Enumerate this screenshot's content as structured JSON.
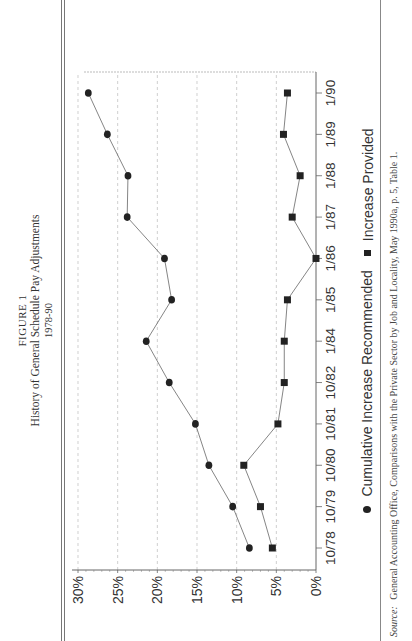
{
  "figure": {
    "label": "FIGURE 1",
    "title": "History of General Schedule Pay Adjustments",
    "subtitle": "1978-90"
  },
  "legend": {
    "items": [
      {
        "marker": "circle",
        "label": "Cumulative Increase Recommended"
      },
      {
        "marker": "square",
        "label": "Increase Provided"
      }
    ]
  },
  "source": {
    "label": "Source:",
    "text": "General Accounting Office, Comparisons with the Private Sector by Job and Locality, May 1990a, p. 5, Table 1."
  },
  "colors": {
    "marker": "#222222",
    "line": "#666666",
    "grid": "#bbbbbb",
    "axis": "#666666",
    "text": "#333333"
  },
  "chart_data": {
    "type": "line",
    "orientation": "rotated 90 degrees counter-clockwise on page",
    "title": "History of General Schedule Pay Adjustments",
    "subtitle": "1978-90",
    "xlabel": "",
    "ylabel": "",
    "categories": [
      "10/78",
      "10/79",
      "10/80",
      "10/81",
      "10/82",
      "1/84",
      "1/85",
      "1/86",
      "1/87",
      "1/88",
      "1/89",
      "1/90"
    ],
    "series": [
      {
        "name": "Cumulative Increase Recommended",
        "marker": "circle",
        "values": [
          8.4,
          10.5,
          13.5,
          15.2,
          18.5,
          21.4,
          18.2,
          19.1,
          23.8,
          23.7,
          26.3,
          28.7
        ]
      },
      {
        "name": "Increase Provided",
        "marker": "square",
        "values": [
          5.5,
          7.0,
          9.1,
          4.8,
          4.0,
          4.0,
          3.6,
          0.0,
          3.0,
          2.0,
          4.1,
          3.6
        ]
      }
    ],
    "yticks": [
      "0%",
      "5%",
      "10%",
      "15%",
      "20%",
      "25%",
      "30%"
    ],
    "ylim": [
      0,
      30
    ],
    "grid": "dashed vertical-in-plot gridlines at each 5%",
    "legend_position": "bottom"
  }
}
